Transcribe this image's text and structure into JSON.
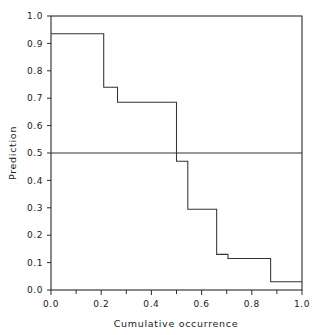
{
  "chart_data": {
    "type": "line",
    "subtype": "step-post",
    "title": "",
    "xlabel": "Cumulative occurrence",
    "ylabel": "Prediction",
    "xlim": [
      0.0,
      1.0
    ],
    "ylim": [
      0.0,
      1.0
    ],
    "grid": false,
    "legend": null,
    "xticks": [
      0.0,
      0.2,
      0.4,
      0.6,
      0.8,
      1.0
    ],
    "xticklabels": [
      "0.0",
      "0.2",
      "0.4",
      "0.6",
      "0.8",
      "1.0"
    ],
    "xminorticks": [
      0.1,
      0.3,
      0.5,
      0.7,
      0.9
    ],
    "yticks": [
      0.0,
      0.1,
      0.2,
      0.3,
      0.4,
      0.5,
      0.6,
      0.7,
      0.8,
      0.9,
      1.0
    ],
    "yticklabels": [
      "0.0",
      "0.1",
      "0.2",
      "0.3",
      "0.4",
      "0.5",
      "0.6",
      "0.7",
      "0.8",
      "0.9",
      "1.0"
    ],
    "steps": [
      {
        "x_start": 0.0,
        "x_end": 0.21,
        "y": 0.935
      },
      {
        "x_start": 0.21,
        "x_end": 0.265,
        "y": 0.74
      },
      {
        "x_start": 0.265,
        "x_end": 0.5,
        "y": 0.685
      },
      {
        "x_start": 0.5,
        "x_end": 0.545,
        "y": 0.47
      },
      {
        "x_start": 0.545,
        "x_end": 0.66,
        "y": 0.295
      },
      {
        "x_start": 0.66,
        "x_end": 0.705,
        "y": 0.13
      },
      {
        "x_start": 0.705,
        "x_end": 0.875,
        "y": 0.115
      },
      {
        "x_start": 0.875,
        "x_end": 1.0,
        "y": 0.03
      }
    ],
    "x": [
      0.0,
      0.21,
      0.265,
      0.5,
      0.545,
      0.66,
      0.705,
      0.875,
      1.0
    ],
    "y": [
      0.935,
      0.74,
      0.685,
      0.47,
      0.295,
      0.13,
      0.115,
      0.03,
      0.03
    ],
    "reference_lines": [
      {
        "orientation": "horizontal",
        "value": 0.5,
        "label": "0.5"
      }
    ],
    "line_color": "#333333",
    "frame_color": "#2b2b2b"
  }
}
